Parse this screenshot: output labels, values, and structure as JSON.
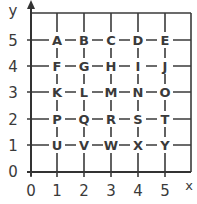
{
  "diagram": {
    "type": "coordinate-grid",
    "axes": {
      "x_label": "x",
      "y_label": "y",
      "x_ticks": [
        "0",
        "1",
        "2",
        "3",
        "4",
        "5"
      ],
      "y_ticks": [
        "0",
        "1",
        "2",
        "3",
        "4",
        "5"
      ]
    },
    "points": [
      {
        "letter": "A",
        "x": 1,
        "y": 5
      },
      {
        "letter": "B",
        "x": 2,
        "y": 5
      },
      {
        "letter": "C",
        "x": 3,
        "y": 5
      },
      {
        "letter": "D",
        "x": 4,
        "y": 5
      },
      {
        "letter": "E",
        "x": 5,
        "y": 5
      },
      {
        "letter": "F",
        "x": 1,
        "y": 4
      },
      {
        "letter": "G",
        "x": 2,
        "y": 4
      },
      {
        "letter": "H",
        "x": 3,
        "y": 4
      },
      {
        "letter": "I",
        "x": 4,
        "y": 4
      },
      {
        "letter": "J",
        "x": 5,
        "y": 4
      },
      {
        "letter": "K",
        "x": 1,
        "y": 3
      },
      {
        "letter": "L",
        "x": 2,
        "y": 3
      },
      {
        "letter": "M",
        "x": 3,
        "y": 3
      },
      {
        "letter": "N",
        "x": 4,
        "y": 3
      },
      {
        "letter": "O",
        "x": 5,
        "y": 3
      },
      {
        "letter": "P",
        "x": 1,
        "y": 2
      },
      {
        "letter": "Q",
        "x": 2,
        "y": 2
      },
      {
        "letter": "R",
        "x": 3,
        "y": 2
      },
      {
        "letter": "S",
        "x": 4,
        "y": 2
      },
      {
        "letter": "T",
        "x": 5,
        "y": 2
      },
      {
        "letter": "U",
        "x": 1,
        "y": 1
      },
      {
        "letter": "V",
        "x": 2,
        "y": 1
      },
      {
        "letter": "W",
        "x": 3,
        "y": 1
      },
      {
        "letter": "X",
        "x": 4,
        "y": 1
      },
      {
        "letter": "Y",
        "x": 5,
        "y": 1
      }
    ],
    "colors": {
      "line": "#3a3a3a",
      "text": "#3a3a3a",
      "background": "#ffffff"
    }
  }
}
